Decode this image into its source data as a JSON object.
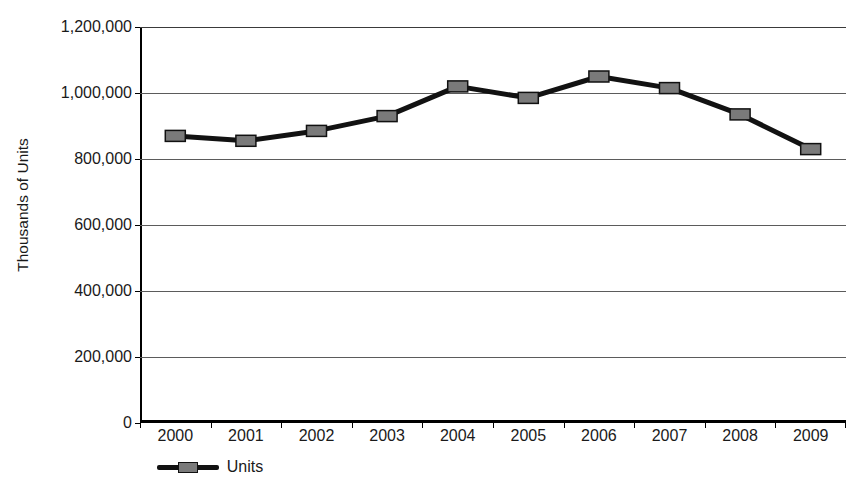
{
  "chart_data": {
    "type": "line",
    "title": "",
    "subtitle": "",
    "xlabel": "",
    "ylabel": "Thousands of Units",
    "categories": [
      "2000",
      "2001",
      "2002",
      "2003",
      "2004",
      "2005",
      "2006",
      "2007",
      "2008",
      "2009"
    ],
    "series": [
      {
        "name": "Units",
        "values": [
          870000,
          855000,
          885000,
          930000,
          1020000,
          985000,
          1050000,
          1015000,
          935000,
          830000
        ]
      }
    ],
    "ylim": [
      0,
      1200000
    ],
    "ytick_values": [
      0,
      200000,
      400000,
      600000,
      800000,
      1000000,
      1200000
    ],
    "ytick_labels": [
      "0",
      "200,000",
      "400,000",
      "600,000",
      "800,000",
      "1,000,000",
      "1,200,000"
    ],
    "xtick_labels": [
      "2000",
      "2001",
      "2002",
      "2003",
      "2004",
      "2005",
      "2006",
      "2007",
      "2008",
      "2009"
    ],
    "grid": true,
    "grid_axis": "y",
    "legend": {
      "position": "bottom-left",
      "entries": [
        {
          "label": "Units",
          "marker": "square",
          "marker_color": "#7a7a7a",
          "line_color": "#121212"
        }
      ]
    },
    "colors": {
      "line": "#121212",
      "marker_fill": "#7a7a7a",
      "marker_stroke": "#111111",
      "gridline": "#5b5b5b",
      "axis": "#000000",
      "text": "#1a1a1a",
      "background": "#ffffff"
    }
  }
}
